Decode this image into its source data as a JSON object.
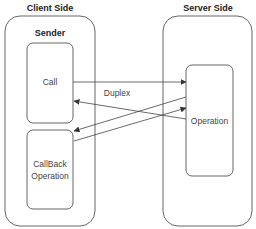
{
  "diagram": {
    "client": {
      "title": "Client Side",
      "subtitle": "Sender",
      "nodes": {
        "call": "Call",
        "callback_line1": "CallBack",
        "callback_line2": "Operation"
      }
    },
    "server": {
      "title": "Server Side",
      "nodes": {
        "operation": "Operation"
      }
    },
    "edges": [
      {
        "from": "Call",
        "to": "Operation",
        "label": "Duplex"
      },
      {
        "from": "Operation",
        "to": "Call",
        "label": ""
      },
      {
        "from": "Operation",
        "to": "CallBack Operation",
        "label": ""
      },
      {
        "from": "CallBack Operation",
        "to": "Operation",
        "label": ""
      }
    ],
    "colors": {
      "stroke": "#555555",
      "text": "#333333",
      "background": "#ffffff"
    }
  }
}
